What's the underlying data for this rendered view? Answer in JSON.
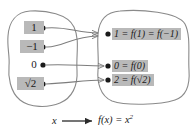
{
  "figure": {
    "type": "mapping-diagram",
    "caption": {
      "input_var": "x",
      "arrow": "⟶",
      "rule": "f(x) = x",
      "exponent": "2",
      "full_text": "x ⟶ f(x) = x²"
    },
    "domain_set": {
      "name": "domain-blob",
      "elements": [
        {
          "label": "1",
          "highlighted": true
        },
        {
          "label": "−1",
          "highlighted": true
        },
        {
          "label": "0",
          "highlighted": false
        },
        {
          "label": "√2",
          "highlighted": true
        }
      ]
    },
    "range_set": {
      "name": "range-blob",
      "elements": [
        {
          "label": "1 = f(1) = f(−1)",
          "highlighted": true
        },
        {
          "label": "0 = f(0)",
          "highlighted": true
        },
        {
          "label": "2 = f(√2)",
          "highlighted": true
        }
      ]
    },
    "arrows": [
      {
        "from": "1",
        "to": "1 = f(1) = f(−1)"
      },
      {
        "from": "−1",
        "to": "1 = f(1) = f(−1)"
      },
      {
        "from": "0",
        "to": "0 = f(0)"
      },
      {
        "from": "√2",
        "to": "2 = f(√2)"
      }
    ],
    "colors": {
      "highlight": "#b9b9b9",
      "outline": "#8a8a8a",
      "arrow": "#7d7d7d",
      "dot": "#1a1a1a",
      "text": "#1a1a1a",
      "background": "#ffffff"
    }
  }
}
